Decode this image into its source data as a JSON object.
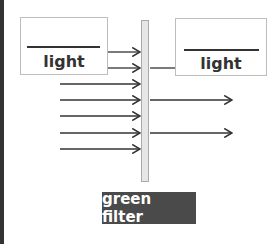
{
  "diagram": {
    "left_box": {
      "blank": "",
      "label": "light"
    },
    "right_box": {
      "blank": "",
      "label": "light"
    },
    "filter_label": "green filter",
    "incoming_arrow_ys": [
      52,
      68,
      84,
      100,
      116,
      133,
      149
    ],
    "outgoing_arrow_ys": [
      100,
      133
    ],
    "line_to_right_box_y": 68
  }
}
